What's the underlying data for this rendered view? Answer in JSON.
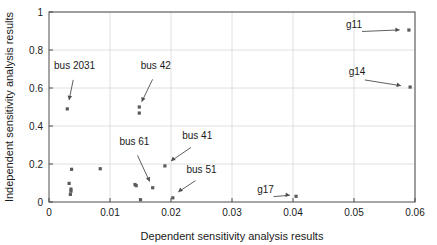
{
  "chart_data": {
    "type": "scatter",
    "title": "",
    "xlabel": "Dependent sensitivity analysis results",
    "ylabel": "Independent sensitivity analysis results",
    "xlim": [
      0,
      0.06
    ],
    "ylim": [
      0,
      1
    ],
    "xticks": [
      0,
      0.01,
      0.02,
      0.03,
      0.04,
      0.05,
      0.06
    ],
    "xticklabels": [
      "0",
      "0.01",
      "0.02",
      "0.03",
      "0.04",
      "0.05",
      "0.06"
    ],
    "yticks": [
      0,
      0.2,
      0.4,
      0.6,
      0.8,
      1
    ],
    "yticklabels": [
      "0",
      "0.2",
      "0.4",
      "0.6",
      "0.8",
      "1"
    ],
    "grid": true,
    "legend": null,
    "marker_color": "#5a5a5a",
    "points": [
      {
        "x": 0.003,
        "y": 0.49
      },
      {
        "x": 0.0037,
        "y": 0.172
      },
      {
        "x": 0.0033,
        "y": 0.098
      },
      {
        "x": 0.0036,
        "y": 0.068
      },
      {
        "x": 0.0036,
        "y": 0.057
      },
      {
        "x": 0.0035,
        "y": 0.04
      },
      {
        "x": 0.0084,
        "y": 0.175
      },
      {
        "x": 0.0141,
        "y": 0.092
      },
      {
        "x": 0.0143,
        "y": 0.086
      },
      {
        "x": 0.0148,
        "y": 0.5
      },
      {
        "x": 0.0148,
        "y": 0.468
      },
      {
        "x": 0.015,
        "y": 0.012
      },
      {
        "x": 0.017,
        "y": 0.075
      },
      {
        "x": 0.019,
        "y": 0.19
      },
      {
        "x": 0.0203,
        "y": 0.022
      },
      {
        "x": 0.0405,
        "y": 0.03
      },
      {
        "x": 0.059,
        "y": 0.905
      },
      {
        "x": 0.0592,
        "y": 0.605
      }
    ],
    "annotations": [
      {
        "text": "bus 2031",
        "label_x": 0.0042,
        "label_y": 0.7,
        "point_x": 0.0032,
        "point_y": 0.52
      },
      {
        "text": "bus 42",
        "label_x": 0.0175,
        "label_y": 0.7,
        "point_x": 0.015,
        "point_y": 0.512
      },
      {
        "text": "bus 61",
        "label_x": 0.014,
        "label_y": 0.3,
        "point_x": 0.0167,
        "point_y": 0.092
      },
      {
        "text": "bus 41",
        "label_x": 0.0243,
        "label_y": 0.33,
        "point_x": 0.0196,
        "point_y": 0.205
      },
      {
        "text": "bus 51",
        "label_x": 0.025,
        "label_y": 0.155,
        "point_x": 0.0208,
        "point_y": 0.042
      },
      {
        "text": "g17",
        "label_x": 0.0355,
        "label_y": 0.048,
        "point_x": 0.04,
        "point_y": 0.034
      },
      {
        "text": "g11",
        "label_x": 0.05,
        "label_y": 0.915,
        "point_x": 0.058,
        "point_y": 0.905
      },
      {
        "text": "g14",
        "label_x": 0.0505,
        "label_y": 0.668,
        "point_x": 0.0582,
        "point_y": 0.608
      }
    ]
  }
}
